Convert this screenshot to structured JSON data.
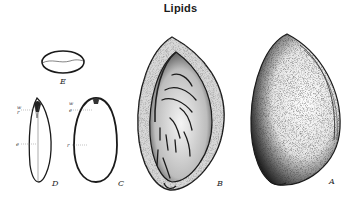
{
  "title": "Lipids",
  "figure": {
    "panels": [
      {
        "id": "A",
        "label": "A",
        "description": "whole seed exterior"
      },
      {
        "id": "B",
        "label": "B",
        "description": "seed with seed coat, textured surface"
      },
      {
        "id": "C",
        "label": "C",
        "description": "outline of seed, side view",
        "annotations": [
          "w",
          "e",
          "r"
        ]
      },
      {
        "id": "D",
        "label": "D",
        "description": "seed section with embryo axis",
        "annotations": [
          "w",
          "r",
          "e"
        ]
      },
      {
        "id": "E",
        "label": "E",
        "description": "cross section, oval"
      }
    ]
  },
  "colors": {
    "ink": "#1a1a1a",
    "background": "#ffffff"
  }
}
